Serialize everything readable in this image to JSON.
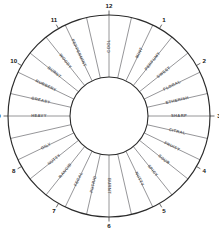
{
  "figure": {
    "name": "odor-classification-wheel",
    "geometry": {
      "center_x": 109,
      "center_y": 116,
      "outer_radius": 101,
      "inner_radius": 39,
      "sector_count": 28,
      "label_radius": 70,
      "clock_number_radius": 110
    },
    "colors": {
      "background": "#ffffff",
      "outer_ring_stroke": "#2b2b2b",
      "inner_ring_stroke": "#2b2b2b",
      "inner_fill": "#ffffff",
      "spoke_stroke": "#55555a",
      "label_text": "#5c5c60",
      "clock_number_text": "#151515"
    }
  },
  "clock_numbers": [
    {
      "label": "12",
      "angle_deg": 0
    },
    {
      "label": "1",
      "angle_deg": 30
    },
    {
      "label": "2",
      "angle_deg": 60
    },
    {
      "label": "3",
      "angle_deg": 90
    },
    {
      "label": "4",
      "angle_deg": 120
    },
    {
      "label": "5",
      "angle_deg": 150
    },
    {
      "label": "6",
      "angle_deg": 180
    },
    {
      "label": "7",
      "angle_deg": 210
    },
    {
      "label": "8",
      "angle_deg": 240
    },
    {
      "label": "9",
      "angle_deg": 270
    },
    {
      "label": "10",
      "angle_deg": 300
    },
    {
      "label": "11",
      "angle_deg": 330
    }
  ],
  "sectors": [
    {
      "label": "COOL",
      "angle_deg": 0
    },
    {
      "label": "MINT",
      "angle_deg": 12.857
    },
    {
      "label": "PERFUMY",
      "angle_deg": 25.714
    },
    {
      "label": "SWEET",
      "angle_deg": 38.571
    },
    {
      "label": "FLORAL",
      "angle_deg": 51.429
    },
    {
      "label": "ETHERISH",
      "angle_deg": 64.286
    },
    {
      "label": "SHARP",
      "angle_deg": 77.143
    },
    {
      "label": "SHARP2",
      "angle_deg": 90
    },
    {
      "label": "CITRAL",
      "angle_deg": 102.857
    },
    {
      "label": "FRUITY",
      "angle_deg": 115.714
    },
    {
      "label": "SOUR",
      "angle_deg": 128.571
    },
    {
      "label": "SPICY",
      "angle_deg": 141.429
    },
    {
      "label": "NUTTY",
      "angle_deg": 154.286
    },
    {
      "label": "BURNT",
      "angle_deg": 167.143
    },
    {
      "label": "BURNT2",
      "angle_deg": 180
    },
    {
      "label": "PUTRID",
      "angle_deg": 192.857
    },
    {
      "label": "FECAL",
      "angle_deg": 205.714
    },
    {
      "label": "RANCID",
      "angle_deg": 218.571
    },
    {
      "label": "NUTTY2",
      "angle_deg": 231.429
    },
    {
      "label": "OILY",
      "angle_deg": 244.286
    },
    {
      "label": "HEAVY",
      "angle_deg": 257.143
    },
    {
      "label": "HEAVY2",
      "angle_deg": 270
    },
    {
      "label": "GREASY",
      "angle_deg": 282.857
    },
    {
      "label": "RUBBERY",
      "angle_deg": 295.714
    },
    {
      "label": "BURNT3",
      "angle_deg": 308.571
    },
    {
      "label": "WOODY",
      "angle_deg": 321.429
    },
    {
      "label": "PEPPERMINT",
      "angle_deg": 334.286
    },
    {
      "label": "COOL2",
      "angle_deg": 347.143
    }
  ],
  "sector_labels_displayed": [
    "COOL",
    "MINT",
    "PERFUMY",
    "SWEET",
    "FLORAL",
    "ETHERISH",
    "SHARP",
    "CITRAL",
    "FRUITY",
    "SOUR",
    "SPICY",
    "NUTTY",
    "BURNT",
    "PUTRID",
    "FECAL",
    "RANCID",
    "NUTTY",
    "OILY",
    "HEAVY",
    "GREASY",
    "RUBBERY",
    "BURNT",
    "WOODY",
    "PEPPERMINT"
  ],
  "labels_by_angle": [
    {
      "text": "COOL",
      "angle_deg": 0
    },
    {
      "text": "MINT",
      "angle_deg": 25.714
    },
    {
      "text": "PERFUMY",
      "angle_deg": 38.571
    },
    {
      "text": "SWEET",
      "angle_deg": 51.429
    },
    {
      "text": "FLORAL",
      "angle_deg": 64.286
    },
    {
      "text": "ETHERISH",
      "angle_deg": 77.143
    },
    {
      "text": "SHARP",
      "angle_deg": 90
    },
    {
      "text": "CITRAL",
      "angle_deg": 102.857
    },
    {
      "text": "FRUITY",
      "angle_deg": 115.714
    },
    {
      "text": "SOUR",
      "angle_deg": 128.571
    },
    {
      "text": "SPICY",
      "angle_deg": 141.429
    },
    {
      "text": "NUTTY",
      "angle_deg": 154.286
    },
    {
      "text": "BURNT",
      "angle_deg": 180
    },
    {
      "text": "PUTRID",
      "angle_deg": 192.857
    },
    {
      "text": "FECAL",
      "angle_deg": 205.714
    },
    {
      "text": "RANCID",
      "angle_deg": 218.571
    },
    {
      "text": "NUTTY",
      "angle_deg": 231.429
    },
    {
      "text": "OILY",
      "angle_deg": 244.286
    },
    {
      "text": "HEAVY",
      "angle_deg": 270
    },
    {
      "text": "GREASY",
      "angle_deg": 282.857
    },
    {
      "text": "RUBBERY",
      "angle_deg": 295.714
    },
    {
      "text": "BURNT",
      "angle_deg": 308.571
    },
    {
      "text": "WOODY",
      "angle_deg": 321.429
    },
    {
      "text": "PEPPERMINT",
      "angle_deg": 334.286
    }
  ]
}
